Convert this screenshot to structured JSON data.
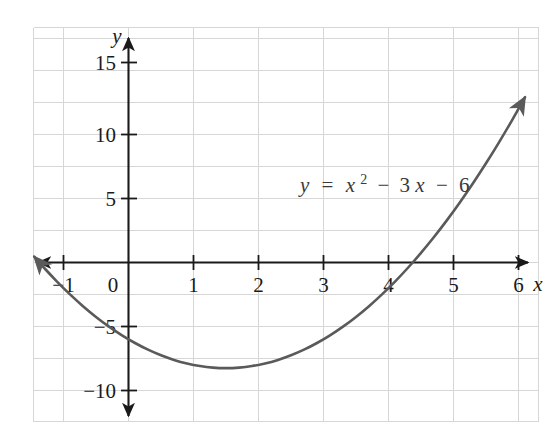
{
  "chart_data": {
    "type": "line",
    "title": "",
    "subtitle": "",
    "xlabel": "x",
    "ylabel": "y",
    "equation_plain": "y = x^2 - 3x - 6",
    "annotation": "y = x² − 3x − 6",
    "annotation_parts": {
      "lhs": "y",
      "equals": "=",
      "var1": "x",
      "exp1": "2",
      "minus1": "−",
      "coef": "3",
      "var2": "x",
      "minus2": "−",
      "const": "6"
    },
    "grid": true,
    "legend": "none",
    "xlim": [
      -1.45,
      6.25
    ],
    "ylim": [
      -11.5,
      17.0
    ],
    "x_ticks": [
      -1,
      0,
      1,
      2,
      3,
      4,
      5,
      6
    ],
    "x_tick_labels": [
      "−1",
      "0",
      "1",
      "2",
      "3",
      "4",
      "5",
      "6"
    ],
    "y_ticks": [
      -10,
      -5,
      5,
      10,
      15
    ],
    "y_tick_labels": [
      "−10",
      "−5",
      "5",
      "10",
      "15"
    ],
    "grid_step_x": 1,
    "grid_step_y": 2.5,
    "vertex": {
      "x": 1.5,
      "y": -8.25
    },
    "roots": [
      -1.372,
      4.372
    ],
    "y_intercept": -6,
    "series": [
      {
        "name": "y = x² − 3x − 6",
        "color": "#5a5a5a",
        "x": [
          -1.45,
          -1.3,
          -1.1,
          -0.9,
          -0.7,
          -0.5,
          -0.3,
          -0.1,
          0.1,
          0.3,
          0.5,
          0.7,
          0.9,
          1.1,
          1.3,
          1.5,
          1.7,
          1.9,
          2.1,
          2.3,
          2.5,
          2.7,
          2.9,
          3.1,
          3.3,
          3.5,
          3.7,
          3.9,
          4.1,
          4.3,
          4.5,
          4.7,
          4.9,
          5.1,
          5.3,
          5.5,
          5.7,
          5.9,
          6.1
        ],
        "y": [
          0.4525,
          -0.41,
          -1.49,
          -2.49,
          -3.41,
          -4.25,
          -5.01,
          -5.69,
          -6.29,
          -6.81,
          -7.25,
          -7.61,
          -7.89,
          -8.09,
          -8.21,
          -8.25,
          -8.21,
          -8.09,
          -7.89,
          -7.61,
          -7.25,
          -6.81,
          -6.29,
          -5.69,
          -5.01,
          -4.25,
          -3.41,
          -2.49,
          -1.49,
          -0.41,
          0.75,
          1.99,
          3.31,
          4.71,
          6.19,
          7.75,
          9.39,
          11.11,
          12.91
        ],
        "arrow_start": true,
        "arrow_end": true
      }
    ]
  },
  "axes": {
    "x_axis_label": "x",
    "y_axis_label": "y",
    "x_arrow_left": true,
    "x_arrow_right": true,
    "y_arrow_up": true,
    "y_arrow_down": true
  },
  "colors": {
    "curve": "#5a5a5a",
    "axis": "#1a1a1a",
    "grid": "#d6d6d6",
    "background": "#ffffff",
    "text": "#1a1a1a",
    "annotation_text": "#3a3a3a"
  }
}
